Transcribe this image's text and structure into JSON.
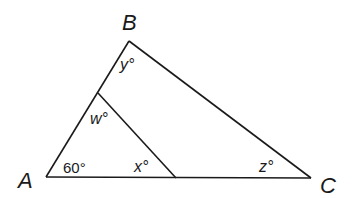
{
  "diagram": {
    "type": "geometry-triangle",
    "vertices": [
      {
        "name": "A",
        "x": 46,
        "y": 177
      },
      {
        "name": "B",
        "x": 129,
        "y": 41
      },
      {
        "name": "C",
        "x": 311,
        "y": 178
      }
    ],
    "labels": {
      "A": "A",
      "B": "B",
      "C": "C"
    },
    "angles": {
      "angle_A": "60°",
      "w": "w°",
      "x": "x°",
      "y": "y°",
      "z": "z°"
    },
    "inner_segment": {
      "from": {
        "x": 98,
        "y": 93
      },
      "to": {
        "x": 176,
        "y": 178
      }
    },
    "line_color": "#1a1a1a",
    "background": "#ffffff"
  }
}
